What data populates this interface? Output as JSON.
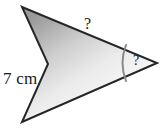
{
  "figure": {
    "kind": "concave-arrowhead-polygon",
    "fill_light": "#fdfdfd",
    "fill_dark": "#9a9a9a",
    "stroke_color": "#262626",
    "stroke_width": 2,
    "background_color": "#ffffff",
    "arc_color": "#8a8a8a",
    "arc_width": 2,
    "vertices": [
      {
        "name": "top-left-point",
        "x": 22,
        "y": 7
      },
      {
        "name": "right-tip-point",
        "x": 157,
        "y": 63
      },
      {
        "name": "bottom-left-point",
        "x": 22,
        "y": 122
      },
      {
        "name": "notch-apex-point",
        "x": 48,
        "y": 64
      }
    ],
    "points_path": "22,7 157,63 22,122 48,64",
    "angle_arc_path": "M 126,45 Q 119,63 126,81"
  },
  "labels": {
    "side_length": "7 cm",
    "unknown_side": "?",
    "unknown_angle": "?"
  }
}
